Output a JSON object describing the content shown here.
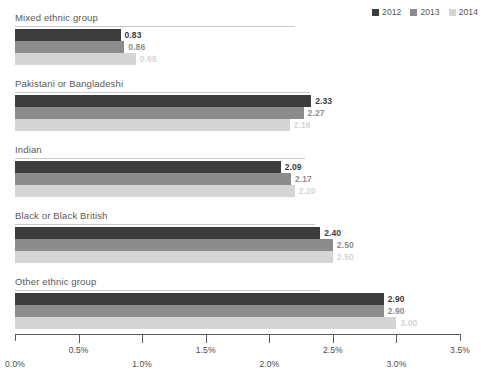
{
  "legend": {
    "items": [
      {
        "label": "2012",
        "color": "#3c3c3c"
      },
      {
        "label": "2013",
        "color": "#8c8c8c"
      },
      {
        "label": "2014",
        "color": "#d5d5d5"
      }
    ]
  },
  "axis": {
    "ticks": [
      {
        "label": "0.0%",
        "value": 0.0
      },
      {
        "label": "0.5%",
        "value": 0.5
      },
      {
        "label": "1.0%",
        "value": 1.0
      },
      {
        "label": "1.5%",
        "value": 1.5
      },
      {
        "label": "2.0%",
        "value": 2.0
      },
      {
        "label": "2.5%",
        "value": 2.5
      },
      {
        "label": "3.0%",
        "value": 3.0
      },
      {
        "label": "3.5%",
        "value": 3.5
      }
    ]
  },
  "groups": [
    {
      "title": "Mixed ethnic group",
      "rule_width": 280,
      "bars": [
        {
          "series": "2012",
          "value": 0.83,
          "label": "0.83",
          "color": "#3c3c3c"
        },
        {
          "series": "2013",
          "value": 0.86,
          "label": "0.86",
          "color": "#8c8c8c"
        },
        {
          "series": "2014",
          "value": 0.95,
          "label": "0.95",
          "color": "#d5d5d5"
        }
      ]
    },
    {
      "title": "Pakistani or Bangladeshi",
      "rule_width": 295,
      "bars": [
        {
          "series": "2012",
          "value": 2.33,
          "label": "2.33",
          "color": "#3c3c3c"
        },
        {
          "series": "2013",
          "value": 2.27,
          "label": "2.27",
          "color": "#8c8c8c"
        },
        {
          "series": "2014",
          "value": 2.16,
          "label": "2.16",
          "color": "#d5d5d5"
        }
      ]
    },
    {
      "title": "Indian",
      "rule_width": 290,
      "bars": [
        {
          "series": "2012",
          "value": 2.09,
          "label": "2.09",
          "color": "#3c3c3c"
        },
        {
          "series": "2013",
          "value": 2.17,
          "label": "2.17",
          "color": "#8c8c8c"
        },
        {
          "series": "2014",
          "value": 2.2,
          "label": "2.20",
          "color": "#d5d5d5"
        }
      ]
    },
    {
      "title": "Black or Black British",
      "rule_width": 300,
      "bars": [
        {
          "series": "2012",
          "value": 2.4,
          "label": "2.40",
          "color": "#3c3c3c"
        },
        {
          "series": "2013",
          "value": 2.5,
          "label": "2.50",
          "color": "#8c8c8c"
        },
        {
          "series": "2014",
          "value": 2.5,
          "label": "2.50",
          "color": "#d5d5d5"
        }
      ]
    },
    {
      "title": "Other ethnic group",
      "rule_width": 305,
      "bars": [
        {
          "series": "2012",
          "value": 2.9,
          "label": "2.90",
          "color": "#3c3c3c"
        },
        {
          "series": "2013",
          "value": 2.9,
          "label": "2.90",
          "color": "#8c8c8c"
        },
        {
          "series": "2014",
          "value": 3.0,
          "label": "3.00",
          "color": "#d5d5d5"
        }
      ]
    }
  ],
  "chart_data": {
    "type": "bar",
    "orientation": "horizontal",
    "title": "",
    "xlabel": "",
    "ylabel": "",
    "xlim": [
      0.0,
      3.5
    ],
    "xunit": "%",
    "grid": false,
    "legend_position": "top-right",
    "categories": [
      "Mixed ethnic group",
      "Pakistani or Bangladeshi",
      "Indian",
      "Black or Black British",
      "Other ethnic group"
    ],
    "series": [
      {
        "name": "2012",
        "color": "#3c3c3c",
        "values": [
          0.83,
          2.33,
          2.09,
          2.4,
          2.9
        ]
      },
      {
        "name": "2013",
        "color": "#8c8c8c",
        "values": [
          0.86,
          2.27,
          2.17,
          2.5,
          2.9
        ]
      },
      {
        "name": "2014",
        "color": "#d5d5d5",
        "values": [
          0.95,
          2.16,
          2.2,
          2.5,
          3.0
        ]
      }
    ],
    "xticks": [
      0.0,
      0.5,
      1.0,
      1.5,
      2.0,
      2.5,
      3.0,
      3.5
    ],
    "xticklabels": [
      "0.0%",
      "0.5%",
      "1.0%",
      "1.5%",
      "2.0%",
      "2.5%",
      "3.0%",
      "3.5%"
    ]
  }
}
